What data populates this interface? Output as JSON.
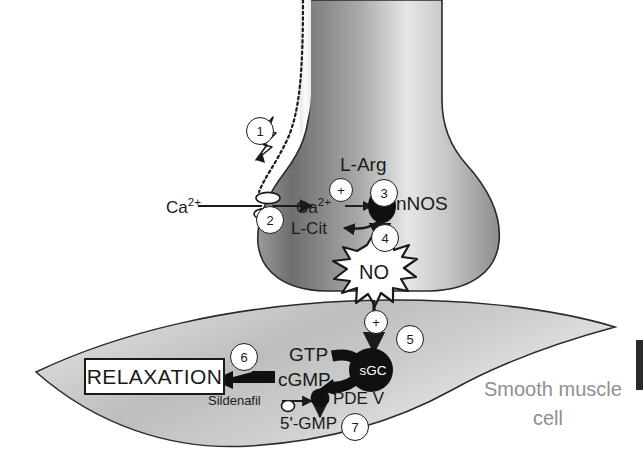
{
  "figure": {
    "background_color": "#ffffff",
    "ink_color": "#1a1a1a",
    "gray_label_color": "#8f8f8f"
  },
  "cells": {
    "nerve": {
      "name": "Nitrergic nerve terminal",
      "fill_light": "#f2f2f2",
      "fill_dark": "#6f6f6f"
    },
    "muscle": {
      "label_line1": "Smooth muscle",
      "label_line2": "cell",
      "fill_light": "#f4f4f4",
      "fill_dark": "#a8a8a8"
    }
  },
  "labels": {
    "ca_extracellular": "Ca",
    "ca_extracellular_sup": "2+",
    "ca_intracellular": "Ca",
    "ca_intracellular_sup": "2+",
    "l_arg": "L-Arg",
    "l_cit": "L-Cit",
    "nnos": "nNOS",
    "no": "NO",
    "sgc": "sGC",
    "gtp": "GTP",
    "cgmp": "cGMP",
    "pde_v": "PDE V",
    "sildenafil": "Sildenafil",
    "gmp5": "5'-GMP",
    "relaxation": "RELAXATION"
  },
  "operators": {
    "activation_nnos": "+",
    "activation_sgc": "+",
    "inhibition_pde": "–"
  },
  "markers": [
    {
      "id": "1",
      "meaning": "action-potential-arrives"
    },
    {
      "id": "2",
      "meaning": "calcium-channel-influx"
    },
    {
      "id": "3",
      "meaning": "nnos-activation"
    },
    {
      "id": "4",
      "meaning": "no-release"
    },
    {
      "id": "5",
      "meaning": "sgc-activation"
    },
    {
      "id": "6",
      "meaning": "relaxation-output"
    },
    {
      "id": "7",
      "meaning": "pde-v-degradation"
    }
  ],
  "icons": {
    "lightning": "action-potential-bolt",
    "channel": "calcium-channel",
    "burst": "no-starburst",
    "dotted_line": "propagating-impulse"
  }
}
